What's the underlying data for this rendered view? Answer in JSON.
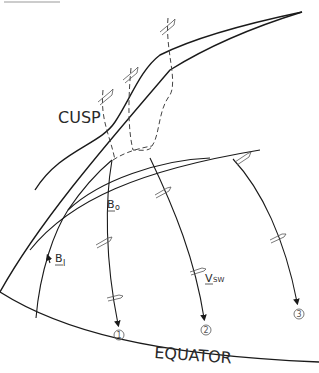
{
  "diagram": {
    "type": "magnetospheric cusp field-line sketch",
    "labels": {
      "cusp": "CUSP",
      "equator": "EQUATOR",
      "b_outer": "B",
      "b_outer_sub": "o",
      "b_inner": "B",
      "b_inner_sub": "I",
      "v_solar_wind": "V",
      "v_solar_wind_sub": "SW"
    },
    "field_lines": [
      {
        "id": "1",
        "marker": "1"
      },
      {
        "id": "2",
        "marker": "2"
      },
      {
        "id": "3",
        "marker": "3"
      }
    ],
    "colors": {
      "line": "#1a1a1a",
      "dashed": "#444444",
      "background": "#ffffff"
    }
  }
}
